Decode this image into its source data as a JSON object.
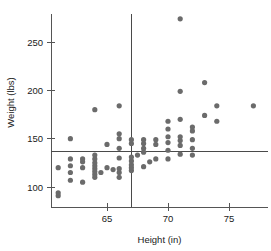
{
  "chart_data": {
    "type": "scatter",
    "title": "",
    "xlabel": "Height (in)",
    "ylabel": "Weight (lbs)",
    "xlim": [
      60.3,
      78.0
    ],
    "ylim": [
      82,
      282
    ],
    "xticks": [
      65,
      70,
      75
    ],
    "xtick_labels": [
      "65",
      "70",
      "75"
    ],
    "yticks": [
      100,
      150,
      200,
      250
    ],
    "ytick_labels": [
      "100",
      "150",
      "200",
      "250"
    ],
    "grid": false,
    "legend": "none",
    "point_color": "#6b6b6b",
    "axis_color": "#555555",
    "reference_lines": {
      "horizontal_y": 137,
      "vertical_x": 67,
      "color": "#4a4a4a",
      "description": "mean weight and mean height crosshair lines"
    },
    "points": [
      {
        "x": 61.0,
        "y": 91
      },
      {
        "x": 61.0,
        "y": 94
      },
      {
        "x": 61.0,
        "y": 120
      },
      {
        "x": 62.0,
        "y": 107
      },
      {
        "x": 62.0,
        "y": 115
      },
      {
        "x": 62.0,
        "y": 122
      },
      {
        "x": 62.0,
        "y": 129
      },
      {
        "x": 62.0,
        "y": 150
      },
      {
        "x": 63.0,
        "y": 105
      },
      {
        "x": 63.0,
        "y": 120
      },
      {
        "x": 63.0,
        "y": 126
      },
      {
        "x": 63.0,
        "y": 129
      },
      {
        "x": 64.0,
        "y": 110
      },
      {
        "x": 64.0,
        "y": 113
      },
      {
        "x": 64.0,
        "y": 116
      },
      {
        "x": 64.0,
        "y": 119
      },
      {
        "x": 64.0,
        "y": 122
      },
      {
        "x": 64.0,
        "y": 125
      },
      {
        "x": 64.0,
        "y": 129
      },
      {
        "x": 64.0,
        "y": 133
      },
      {
        "x": 64.0,
        "y": 180
      },
      {
        "x": 64.5,
        "y": 115
      },
      {
        "x": 65.0,
        "y": 120
      },
      {
        "x": 65.0,
        "y": 144
      },
      {
        "x": 65.5,
        "y": 118
      },
      {
        "x": 66.0,
        "y": 110
      },
      {
        "x": 66.0,
        "y": 115
      },
      {
        "x": 66.0,
        "y": 119
      },
      {
        "x": 66.0,
        "y": 130
      },
      {
        "x": 66.0,
        "y": 140
      },
      {
        "x": 66.0,
        "y": 150
      },
      {
        "x": 66.0,
        "y": 155
      },
      {
        "x": 66.0,
        "y": 184
      },
      {
        "x": 67.0,
        "y": 117
      },
      {
        "x": 67.0,
        "y": 120
      },
      {
        "x": 67.0,
        "y": 123
      },
      {
        "x": 67.0,
        "y": 127
      },
      {
        "x": 67.0,
        "y": 131
      },
      {
        "x": 67.0,
        "y": 145
      },
      {
        "x": 67.0,
        "y": 149
      },
      {
        "x": 67.5,
        "y": 133
      },
      {
        "x": 68.0,
        "y": 121
      },
      {
        "x": 68.0,
        "y": 136
      },
      {
        "x": 68.0,
        "y": 140
      },
      {
        "x": 68.0,
        "y": 145
      },
      {
        "x": 68.0,
        "y": 149
      },
      {
        "x": 68.5,
        "y": 126
      },
      {
        "x": 69.0,
        "y": 129
      },
      {
        "x": 69.0,
        "y": 144
      },
      {
        "x": 69.0,
        "y": 149
      },
      {
        "x": 70.0,
        "y": 129
      },
      {
        "x": 70.0,
        "y": 138
      },
      {
        "x": 70.0,
        "y": 146
      },
      {
        "x": 70.0,
        "y": 152
      },
      {
        "x": 70.0,
        "y": 160
      },
      {
        "x": 70.0,
        "y": 168
      },
      {
        "x": 71.0,
        "y": 134
      },
      {
        "x": 71.0,
        "y": 143
      },
      {
        "x": 71.0,
        "y": 148
      },
      {
        "x": 71.0,
        "y": 152
      },
      {
        "x": 71.0,
        "y": 170
      },
      {
        "x": 71.0,
        "y": 199
      },
      {
        "x": 71.0,
        "y": 274
      },
      {
        "x": 72.0,
        "y": 133
      },
      {
        "x": 72.0,
        "y": 140
      },
      {
        "x": 72.0,
        "y": 149
      },
      {
        "x": 72.0,
        "y": 158
      },
      {
        "x": 72.0,
        "y": 162
      },
      {
        "x": 73.0,
        "y": 174
      },
      {
        "x": 73.0,
        "y": 208
      },
      {
        "x": 74.0,
        "y": 168
      },
      {
        "x": 74.0,
        "y": 184
      },
      {
        "x": 77.0,
        "y": 184
      }
    ]
  }
}
